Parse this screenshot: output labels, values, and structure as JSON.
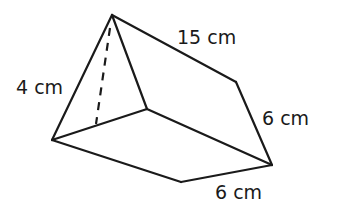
{
  "diagram": {
    "type": "triangular-prism",
    "labels": {
      "height": "4 cm",
      "length": "15 cm",
      "side": "6 cm",
      "base": "6 cm"
    },
    "colors": {
      "stroke": "#1a1a1a",
      "background": "#ffffff"
    }
  }
}
